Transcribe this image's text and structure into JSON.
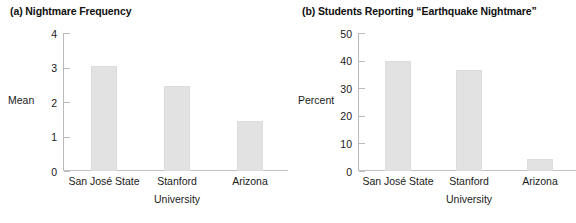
{
  "figure": {
    "panels": [
      {
        "key": "a",
        "label": "(a)",
        "title": "(a) Nightmare Frequency"
      },
      {
        "key": "b",
        "label": "(b)",
        "title": "(b) Students Reporting “Earthquake Nightmare”"
      }
    ]
  },
  "chart_data": [
    {
      "type": "bar",
      "panel": "a",
      "title": "(a) Nightmare Frequency",
      "categories": [
        "San José State",
        "Stanford",
        "Arizona"
      ],
      "values": [
        3.05,
        2.45,
        1.45
      ],
      "xlabel": "University",
      "ylabel": "Mean",
      "ylim": [
        0,
        4
      ],
      "yticks": [
        0,
        1,
        2,
        3,
        4
      ],
      "ytick_labels": [
        "0",
        "1",
        "2",
        "3",
        "4"
      ],
      "grid": false,
      "legend": "none",
      "bar_color": "#e2e2e2"
    },
    {
      "type": "bar",
      "panel": "b",
      "title": "(b) Students Reporting “Earthquake Nightmare”",
      "categories": [
        "San José State",
        "Stanford",
        "Arizona"
      ],
      "values": [
        39.8,
        36.6,
        4.5
      ],
      "xlabel": "University",
      "ylabel": "Percent",
      "ylim": [
        0,
        50
      ],
      "yticks": [
        0,
        10,
        20,
        30,
        40,
        50
      ],
      "ytick_labels": [
        "0",
        "10",
        "20",
        "30",
        "40",
        "50"
      ],
      "grid": false,
      "legend": "none",
      "bar_color": "#e2e2e2"
    }
  ]
}
